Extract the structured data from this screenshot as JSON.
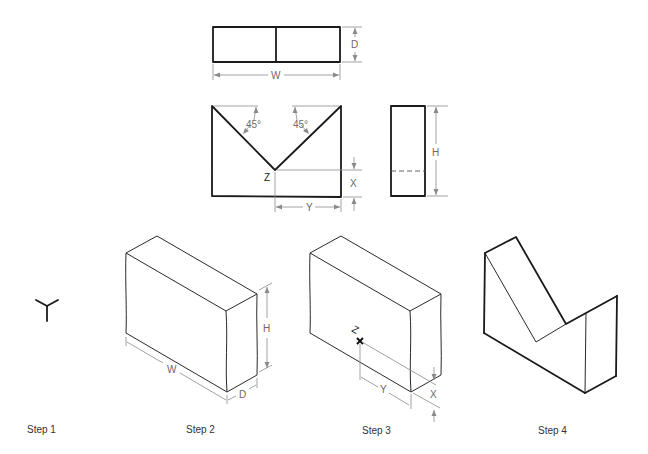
{
  "figure": {
    "views": {
      "top_view": {
        "dimensions": {
          "width_label": "W",
          "depth_label": "D"
        }
      },
      "front_view": {
        "angle_left": "45°",
        "angle_right": "45°",
        "point_label": "Z",
        "x_label": "X",
        "y_label": "Y"
      },
      "side_view": {
        "height_label": "H"
      }
    },
    "steps": [
      {
        "label": "Step 1"
      },
      {
        "label": "Step 2",
        "dims": {
          "w": "W",
          "h": "H",
          "d": "D"
        }
      },
      {
        "label": "Step 3",
        "dims": {
          "z": "Z",
          "x": "X",
          "y": "Y"
        }
      },
      {
        "label": "Step 4"
      }
    ]
  }
}
